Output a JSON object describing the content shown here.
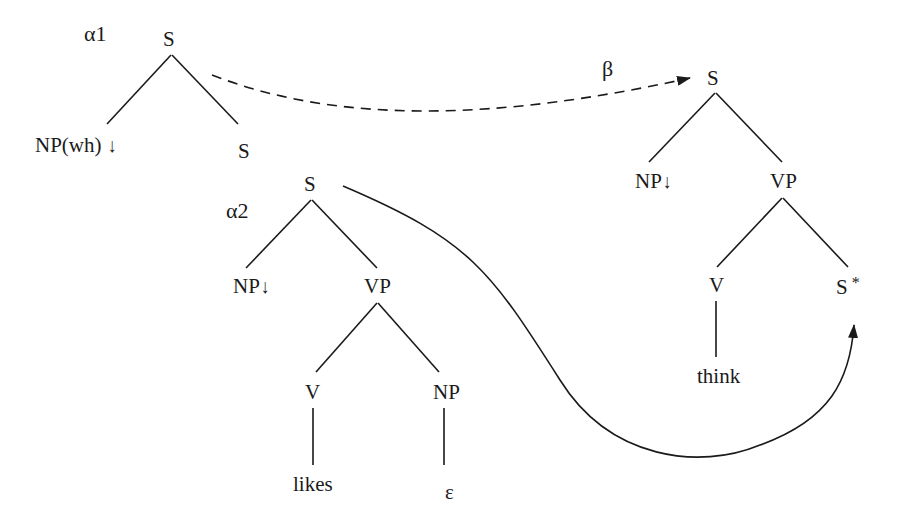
{
  "diagram": {
    "type": "TAG derivation (substitution and adjunction)",
    "trees": {
      "alpha1": {
        "name": "α1",
        "root": "S",
        "children": [
          "NP(wh)",
          "S"
        ],
        "np_marker": "↓"
      },
      "alpha2": {
        "name": "α2",
        "root": "S",
        "np": "NP",
        "np_marker": "↓",
        "vp": "VP",
        "v": "V",
        "v_word": "likes",
        "obj": "NP",
        "obj_word": "ε"
      },
      "beta": {
        "name": "β",
        "root": "S",
        "np": "NP",
        "np_marker": "↓",
        "vp": "VP",
        "v": "V",
        "v_word": "think",
        "foot": "S",
        "foot_marker": "*"
      }
    },
    "edges": [
      {
        "from": "alpha1.S",
        "to": "beta.S",
        "style": "dashed",
        "label": "β"
      },
      {
        "from": "alpha2.S",
        "to": "beta.S*",
        "style": "solid-curve"
      }
    ]
  }
}
